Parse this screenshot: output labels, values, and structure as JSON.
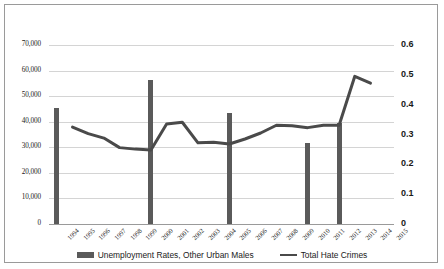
{
  "chart_data": {
    "type": "bar",
    "title": "",
    "xlabel": "",
    "categories": [
      "1994",
      "1995",
      "1996",
      "1997",
      "1998",
      "1999",
      "2000",
      "2001",
      "2002",
      "2003",
      "2004",
      "2005",
      "2006",
      "2007",
      "2008",
      "2009",
      "2010",
      "2011",
      "2012",
      "2013",
      "2014",
      "2015"
    ],
    "grid": true,
    "legend_position": "bottom",
    "axes": {
      "left": {
        "label": "",
        "ylim": [
          0,
          70000
        ],
        "ticks": [
          0,
          10000,
          20000,
          30000,
          40000,
          50000,
          60000,
          70000
        ],
        "tick_labels": [
          "0",
          "10,000",
          "20,000",
          "30,000",
          "40,000",
          "50,000",
          "60,000",
          "70,000"
        ]
      },
      "right": {
        "label": "",
        "ylim": [
          0,
          0.6
        ],
        "ticks": [
          0,
          0.1,
          0.2,
          0.3,
          0.4,
          0.5,
          0.6
        ],
        "tick_labels": [
          "0",
          "0.1",
          "0.2",
          "0.3",
          "0.4",
          "0.5",
          "0.6"
        ]
      }
    },
    "series": [
      {
        "name": "Unemployment Rates, Other Urban Males",
        "type": "bar",
        "axis": "left",
        "color": "#5a5a5a",
        "values": [
          45300,
          null,
          null,
          null,
          null,
          null,
          56200,
          null,
          null,
          null,
          null,
          43500,
          null,
          null,
          null,
          null,
          31700,
          null,
          39600,
          null,
          null,
          null
        ]
      },
      {
        "name": "Total Hate Crimes",
        "type": "line",
        "axis": "right",
        "color": "#4a4a4a",
        "values": [
          null,
          0.325,
          0.303,
          0.288,
          0.256,
          0.251,
          0.248,
          0.335,
          0.341,
          0.272,
          0.274,
          0.268,
          0.285,
          0.305,
          0.331,
          0.329,
          0.323,
          0.331,
          0.331,
          0.495,
          0.472,
          null
        ]
      }
    ]
  },
  "legend": {
    "bar_label": "Unemployment Rates, Other Urban Males",
    "line_label": "Total Hate Crimes"
  }
}
